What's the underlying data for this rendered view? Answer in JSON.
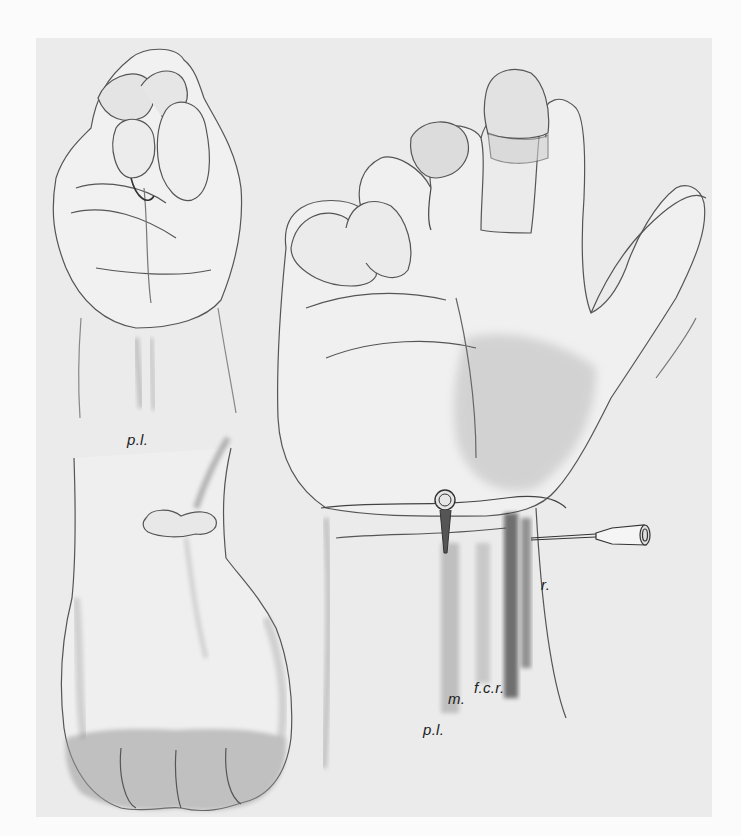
{
  "figure": {
    "colors": {
      "page_background": "#fbfbfb",
      "panel_background": "#ebebeb",
      "ink": "#1c1c1c"
    },
    "labels": {
      "top_left_pl": "p.l.",
      "right_r": "r.",
      "right_m": "m.",
      "right_fcr": "f.c.r.",
      "right_pl": "p.l."
    }
  }
}
